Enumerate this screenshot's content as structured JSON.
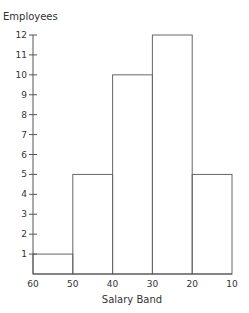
{
  "chart_data": {
    "type": "bar",
    "title": "",
    "xlabel": "Salary Band",
    "ylabel": "Employees",
    "x_ticks": [
      "60",
      "50",
      "40",
      "30",
      "20",
      "10"
    ],
    "y_ticks": [
      "1",
      "2",
      "3",
      "4",
      "5",
      "6",
      "7",
      "8",
      "9",
      "10",
      "11",
      "12"
    ],
    "categories": [
      "60-50",
      "50-40",
      "40-30",
      "30-20",
      "20-10"
    ],
    "values": [
      1,
      5,
      10,
      12,
      5
    ],
    "ylim": [
      0,
      12
    ],
    "grid": false,
    "legend": null,
    "bar_style": "histogram outline"
  }
}
